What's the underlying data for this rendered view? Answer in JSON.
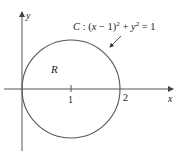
{
  "figure": {
    "axes": {
      "x_label": "x",
      "y_label": "y",
      "tick_labels": [
        "1",
        "2"
      ]
    },
    "curve": {
      "name": "C",
      "equation_prefix": "C : (",
      "equation_var_x": "x",
      "equation_minus_one": " − 1)",
      "equation_sq1": "2",
      "equation_plus": " + ",
      "equation_var_y": "y",
      "equation_sq2": "2",
      "equation_rhs": " = 1",
      "center": [
        1,
        0
      ],
      "radius": 1
    },
    "region_label": "R",
    "colors": {
      "stroke": "#555555",
      "text": "#222222",
      "background": "#ffffff"
    }
  }
}
